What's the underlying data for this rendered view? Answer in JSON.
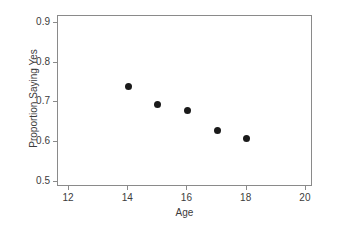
{
  "chart_data": {
    "type": "scatter",
    "title": "",
    "xlabel": "Age",
    "ylabel": "Proportion Saying Yes",
    "xlim": [
      11.63,
      20.24
    ],
    "ylim": [
      0.4878,
      0.9171
    ],
    "xticks": [
      12,
      14,
      16,
      18,
      20
    ],
    "xticklabels": [
      "12",
      "14",
      "16",
      "18",
      "20"
    ],
    "yticks": [
      0.5,
      0.6,
      0.7,
      0.8,
      0.9
    ],
    "yticklabels": [
      "0.5",
      "0.6",
      "0.7",
      "0.8",
      "0.9"
    ],
    "grid": false,
    "legend": null,
    "marker": "filled-circle",
    "marker_color": "#1a1a1a",
    "marker_size_px": 7,
    "frame_color": "#8a8a8a",
    "background_color": "#ffffff",
    "x": [
      14,
      15,
      16,
      17,
      18
    ],
    "y": [
      0.74,
      0.695,
      0.68,
      0.63,
      0.61
    ],
    "points": [
      {
        "x": 14,
        "y": 0.74
      },
      {
        "x": 15,
        "y": 0.695
      },
      {
        "x": 16,
        "y": 0.68
      },
      {
        "x": 17,
        "y": 0.63
      },
      {
        "x": 18,
        "y": 0.61
      }
    ]
  }
}
